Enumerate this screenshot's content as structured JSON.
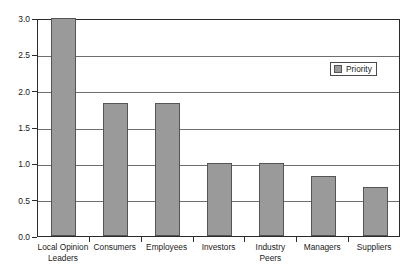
{
  "chart_data": {
    "type": "bar",
    "title": "",
    "subtitle": "",
    "xlabel": "",
    "ylabel": "",
    "categories": [
      "Local Opinion\nLeaders",
      "Consumers",
      "Employees",
      "Investors",
      "Industry Peers",
      "Managers",
      "Suppliers"
    ],
    "series": [
      {
        "name": "Priority",
        "values": [
          3.0,
          1.83,
          1.83,
          1.0,
          1.0,
          0.83,
          0.67
        ],
        "color": "#9a9a9a"
      }
    ],
    "ylim": [
      0.0,
      3.0
    ],
    "yticks": [
      "0.0",
      "0.5",
      "1.0",
      "1.5",
      "2.0",
      "2.5",
      "3.0"
    ],
    "ytick_values": [
      0.0,
      0.5,
      1.0,
      1.5,
      2.0,
      2.5,
      3.0
    ],
    "grid": true,
    "grid_axis": "y",
    "legend": {
      "position": "upper right",
      "entries": [
        {
          "label": "Priority",
          "color": "#9a9a9a"
        }
      ]
    },
    "colors": {
      "bar_fill": "#9a9a9a",
      "bar_edge": "#555555",
      "gridline": "#6e6e6e",
      "frame": "#2b2b2b",
      "text": "#1a1a1a",
      "background": "#ffffff"
    }
  }
}
